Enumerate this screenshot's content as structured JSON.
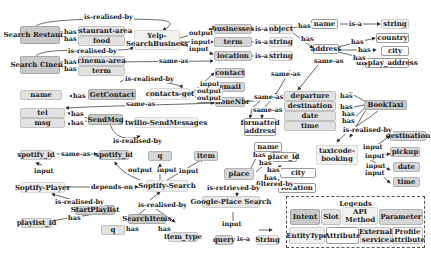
{
  "nodes": {
    "search_restaurant": "Search Restaurant",
    "restaurant_area": "restaurant-area",
    "food": "food",
    "search_cinema": "Search Cinema",
    "cinema_area": "cinema-area",
    "term_cinema": "term",
    "yelp": "Yelp-SearchBusiness",
    "businesses": "businesses",
    "term": "term",
    "location": "location",
    "object": "object",
    "string1": "string",
    "string2": "string",
    "name_top": "name",
    "string_top": "string",
    "address": "address",
    "country": "country",
    "city_top": "city",
    "display_address": "display_address",
    "name_left": "name",
    "getcontact": "GetContact",
    "contacts_get": "contacts-get",
    "contact": "contact",
    "email": "email",
    "phonenbr": "PhoneNbr",
    "tel": "tel",
    "msg": "msg",
    "sendmsg": "SendMsg",
    "twilio": "twilio-SendMessages",
    "departure": "departure",
    "destination": "destination",
    "date": "date",
    "time": "time",
    "booktaxi": "BookTaxi",
    "taxicode": "taxicode-booking",
    "t_destination": "destination",
    "t_pickup": "pickup",
    "t_date": "date",
    "t_time": "time",
    "formatted_address": "formatted address",
    "spotify_id_left": "spotify_id",
    "spotify_id_mid": "spotify_id",
    "q_mid": "q",
    "item": "item",
    "place": "place",
    "name_place": "name",
    "place_id": "place_id",
    "city_place": "city",
    "location_place": "location",
    "soptify_player": "Soptify-Player",
    "soptify_search": "Soptify-Search",
    "google_place": "Google-Place Search",
    "startplaylist": "StartPlaylist",
    "playlist_id": "playlist_id",
    "searchitems": "SearchItems",
    "q_bottom": "q",
    "item_type": "item_type",
    "query": "query",
    "String": "String"
  },
  "edges": {
    "is_realised_by": "is-realised-by",
    "has": "has",
    "is_a": "is-a",
    "same_as": "same-as",
    "input": "input",
    "output": "output",
    "depends_on": "depends-on",
    "is_retrieved_by": "is-retrieved-by",
    "filtered_by": "filtered-by"
  },
  "legend": {
    "title": "Legends",
    "items": [
      "Intent",
      "Slot",
      "API Method",
      "Parameter",
      "EntityType",
      "Attribute",
      "External service",
      "Profile attribute"
    ]
  }
}
